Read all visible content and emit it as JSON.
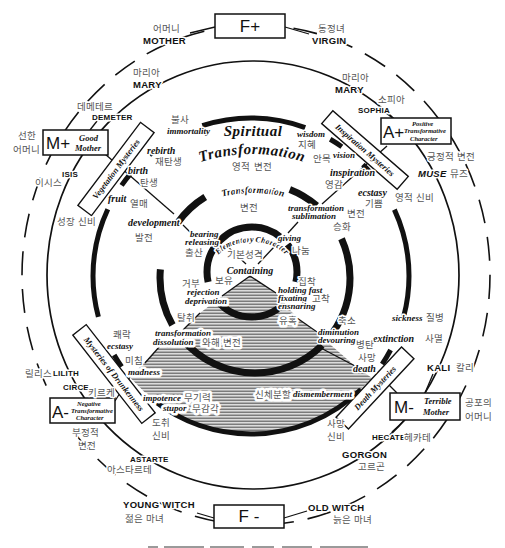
{
  "colors": {
    "ink": "#111111",
    "korean_text": "#555555",
    "hatch": "#5a5a5a",
    "background": "#ffffff"
  },
  "boxes": {
    "f_plus": "F+",
    "f_minus": "F -",
    "m_plus": {
      "symbol": "M+",
      "line1": "Good",
      "line2": "Mother"
    },
    "a_plus": {
      "symbol": "A+",
      "line1": "Positive",
      "line2": "Transformative",
      "line3": "Character"
    },
    "m_minus": {
      "symbol": "M-",
      "line1": "Terrible",
      "line2": "Mother"
    },
    "a_minus": {
      "symbol": "A-",
      "line1": "Negative",
      "line2": "Transformative",
      "line3": "Character"
    }
  },
  "box_ko": {
    "good_mother_1": "선한",
    "good_mother_2": "어머니",
    "positive": "긍정적 변전",
    "terrible_mother_1": "공포의",
    "terrible_mother_2": "어머니",
    "negative_1": "부정적",
    "negative_2": "변전"
  },
  "figures": {
    "mother": {
      "en": "MOTHER",
      "ko": "어머니"
    },
    "virgin": {
      "en": "VIRGIN",
      "ko": "동정녀"
    },
    "mary_left": {
      "en": "MARY",
      "ko": "마리아"
    },
    "mary_right": {
      "en": "MARY",
      "ko": "마리아"
    },
    "sophia": {
      "en": "SOPHIA",
      "ko": "소피아"
    },
    "demeter": {
      "en": "DEMETER",
      "ko": "데메테르"
    },
    "isis": {
      "en": "ISIS",
      "ko": "이시스"
    },
    "muse": {
      "en": "MUSE",
      "ko": "뮤즈"
    },
    "kali": {
      "en": "KALI",
      "ko": "칼리"
    },
    "hecate": {
      "en": "HECATE",
      "ko": "헤카테"
    },
    "gorgon": {
      "en": "GORGON",
      "ko": "고르곤"
    },
    "old_witch": {
      "en": "OLD WITCH",
      "ko": "늙은 마녀"
    },
    "young_witch": {
      "en": "YOUNG WITCH",
      "ko": "젊은 마녀"
    },
    "astarte": {
      "en": "ASTARTE",
      "ko": "아스타르테"
    },
    "circe": {
      "en": "CIRCE",
      "ko": "키르케"
    },
    "lilith": {
      "en": "LILITH",
      "ko": "릴리스"
    }
  },
  "mysteries": {
    "vegetation": {
      "en": "Vegetation Mysteries",
      "ko": "성장 신비"
    },
    "inspiration": {
      "en": "Inspiration Mysteries",
      "ko": "영적 신비"
    },
    "drunkenness": {
      "en": "Mysteries of Drunkenness",
      "ko_1": "도취",
      "ko_2": "신비"
    },
    "death": {
      "en": "Death Mysteries",
      "ko_1": "사망",
      "ko_2": "신비"
    }
  },
  "spiritual": {
    "line1": "Spiritual",
    "line2": "Transformation",
    "ko": "영적 변전"
  },
  "outer_ring": {
    "immortality": {
      "en": "immortality",
      "ko": "불사"
    },
    "rebirth": {
      "en": "rebirth",
      "ko": "재탄생"
    },
    "birth": {
      "en": "birth",
      "ko": "탄생"
    },
    "fruit": {
      "en": "fruit",
      "ko": "열매"
    },
    "wisdom": {
      "en": "wisdom",
      "ko": "지혜"
    },
    "vision": {
      "en": "vision",
      "ko": "안목"
    },
    "inspiration": {
      "en": "inspiration",
      "ko": "영감"
    },
    "ecstasy_pos": {
      "en": "ecstasy",
      "ko": "기쁨"
    },
    "sickness": {
      "en": "sickness",
      "ko": "질병"
    },
    "extinction": {
      "en": "extinction",
      "ko": "사멸"
    },
    "death": {
      "en": "death",
      "ko": "사망"
    },
    "dismemberment": {
      "en": "dismemberment",
      "ko": "신체분할"
    },
    "impotence": {
      "en": "impotence",
      "ko": "무기력"
    },
    "stupor": {
      "en": "stupor",
      "ko": "무감각"
    },
    "madness": {
      "en": "madness",
      "ko": "미침"
    },
    "ecstasy_neg": {
      "en": "ecstasy",
      "ko": "쾌락"
    }
  },
  "transformation_ring": {
    "title": "Transformation",
    "ko": "변전",
    "development": {
      "en": "development",
      "ko": "발전"
    },
    "sublimation": {
      "en1": "transformation",
      "en2": "sublimation",
      "ko1": "변전",
      "ko2": "승화"
    },
    "dissolution": {
      "en1": "transformation",
      "en2": "dissolution",
      "ko": "와해 변전"
    },
    "diminution": {
      "en1": "diminution",
      "en2": "devouring",
      "ko1": "축소",
      "ko2": "병탄"
    }
  },
  "elementary": {
    "title": "Elementary Character",
    "ko": "기본성격",
    "containing": {
      "en": "Containing",
      "ko": "보유"
    },
    "bearing": {
      "en1": "bearing",
      "en2": "releasing",
      "ko": "출산"
    },
    "giving": {
      "en": "giving",
      "ko": "나눔"
    },
    "rejection": {
      "en1": "rejection",
      "en2": "deprivation",
      "ko1": "거부",
      "ko2": "탈취"
    },
    "holding": {
      "en1": "holding fast",
      "en2": "fixating",
      "en3": "ensnaring",
      "ko1": "집착",
      "ko2": "고착",
      "ko3": "유혹"
    }
  }
}
